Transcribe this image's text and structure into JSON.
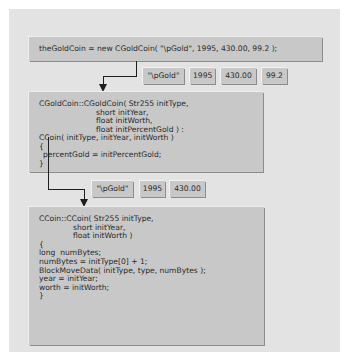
{
  "diagram": {
    "call_statement": "theGoldCoin = new CGoldCoin( \"\\pGold\", 1995, 430.00, 99.2 );",
    "args_level1": [
      "\"\\pGold\"",
      "1995",
      "430.00",
      "99.2"
    ],
    "cgoldcoin_constructor": {
      "lines": [
        "CGoldCoin::CGoldCoin( Str255 initType,",
        "                     short initYear,",
        "                     float initWorth,",
        "                     float initPercentGold ) :",
        "CCoin( initType, initYear, initWorth )",
        "{",
        "    percentGold = initPercentGold;",
        "}"
      ]
    },
    "args_level2": [
      "\"\\pGold\"",
      "1995",
      "430.00"
    ],
    "ccoin_constructor": {
      "lines": [
        "CCoin::CCoin( Str255 initType,",
        "             short initYear,",
        "             float initWorth )",
        "{",
        "   long  numBytes;",
        "",
        "   numBytes = initType[0] + 1;",
        "   BlockMoveData( initType, type, numBytes );",
        "",
        "   year = initYear;",
        "   worth = initWorth;",
        "}"
      ]
    }
  }
}
